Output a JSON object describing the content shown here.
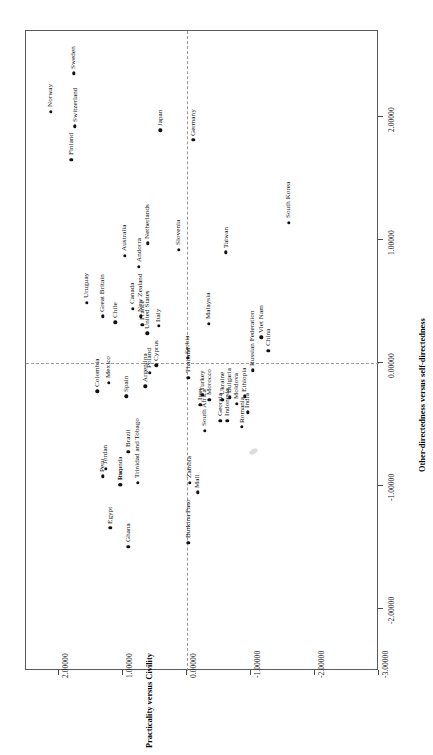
{
  "chart_data": {
    "type": "scatter",
    "title": "",
    "xlabel": "Practicality versus Civility",
    "ylabel": "Other-directedness versus self-directedness",
    "xlim": [
      2.0,
      -3.0
    ],
    "ylim": [
      -2.6,
      2.6
    ],
    "xticks": [
      "2.00000",
      "1.00000",
      "0.00000",
      "-1.00000",
      "-2.00000",
      "-3.00000"
    ],
    "xtickvalues": [
      2.0,
      1.0,
      0.0,
      -1.0,
      -2.0,
      -3.0
    ],
    "yticks": [
      "-2.00000",
      "-1.00000",
      "0.00000",
      "1.00000",
      "2.00000"
    ],
    "ytickvalues": [
      -2.0,
      -1.0,
      0.0,
      1.0,
      2.0
    ],
    "grid": false,
    "reference_lines": {
      "x": 0.0,
      "y": 0.0,
      "style": "dashed"
    },
    "orientation": "rotated-90-ccw",
    "legend": null,
    "points": [
      {
        "label": "Sweden",
        "x": 1.77,
        "y": 2.35
      },
      {
        "label": "Norway",
        "x": 2.13,
        "y": 2.04
      },
      {
        "label": "Switzerland",
        "x": 1.75,
        "y": 1.92
      },
      {
        "label": "Finland",
        "x": 1.81,
        "y": 1.65
      },
      {
        "label": "Japan",
        "x": 0.42,
        "y": 1.89
      },
      {
        "label": "Germany",
        "x": -0.1,
        "y": 1.81
      },
      {
        "label": "Uruguay",
        "x": 1.57,
        "y": 0.49
      },
      {
        "label": "Great Britain",
        "x": 1.32,
        "y": 0.38
      },
      {
        "label": "Australia",
        "x": 0.97,
        "y": 0.87
      },
      {
        "label": "Andorra",
        "x": 0.75,
        "y": 0.78
      },
      {
        "label": "Netherlands",
        "x": 0.61,
        "y": 0.97
      },
      {
        "label": "Canada",
        "x": 0.85,
        "y": 0.44
      },
      {
        "label": "Chile",
        "x": 1.12,
        "y": 0.33
      },
      {
        "label": "New Zealand",
        "x": 0.72,
        "y": 0.38
      },
      {
        "label": "France",
        "x": 0.7,
        "y": 0.31
      },
      {
        "label": "United States",
        "x": 0.62,
        "y": 0.24
      },
      {
        "label": "Italy",
        "x": 0.44,
        "y": 0.3
      },
      {
        "label": "Slovenia",
        "x": 0.13,
        "y": 0.92
      },
      {
        "label": "Taiwan",
        "x": -0.61,
        "y": 0.9
      },
      {
        "label": "South Korea",
        "x": -1.59,
        "y": 1.14
      },
      {
        "label": "Malaysia",
        "x": -0.34,
        "y": 0.32
      },
      {
        "label": "Cyprus",
        "x": 0.48,
        "y": -0.02
      },
      {
        "label": "Poland",
        "x": 0.58,
        "y": -0.08
      },
      {
        "label": "Mexico",
        "x": 1.22,
        "y": -0.16
      },
      {
        "label": "Colombia",
        "x": 1.4,
        "y": -0.23
      },
      {
        "label": "Spain",
        "x": 0.95,
        "y": -0.27
      },
      {
        "label": "Argentina",
        "x": 0.65,
        "y": -0.19
      },
      {
        "label": "Serbia",
        "x": -0.01,
        "y": 0.04
      },
      {
        "label": "Thailand",
        "x": -0.02,
        "y": -0.12
      },
      {
        "label": "Russian Federation",
        "x": -1.03,
        "y": -0.06
      },
      {
        "label": "China",
        "x": -1.27,
        "y": 0.1
      },
      {
        "label": "Viet Nam",
        "x": -1.16,
        "y": 0.21
      },
      {
        "label": "Turkey",
        "x": -0.24,
        "y": -0.26
      },
      {
        "label": "Iran",
        "x": -0.21,
        "y": -0.34
      },
      {
        "label": "Morocco",
        "x": -0.35,
        "y": -0.3
      },
      {
        "label": "Ukraine",
        "x": -0.55,
        "y": -0.3
      },
      {
        "label": "Bulgaria",
        "x": -0.67,
        "y": -0.28
      },
      {
        "label": "Moldova",
        "x": -0.78,
        "y": -0.33
      },
      {
        "label": "Ethiopia",
        "x": -0.9,
        "y": -0.27
      },
      {
        "label": "India",
        "x": -0.95,
        "y": -0.4
      },
      {
        "label": "Indonesia",
        "x": -0.63,
        "y": -0.47
      },
      {
        "label": "Georgia",
        "x": -0.52,
        "y": -0.47
      },
      {
        "label": "Romania",
        "x": -0.86,
        "y": -0.52
      },
      {
        "label": "Brazil",
        "x": 0.92,
        "y": -0.72
      },
      {
        "label": "South Africa",
        "x": -0.28,
        "y": -0.55
      },
      {
        "label": "Peru",
        "x": 1.32,
        "y": -0.92
      },
      {
        "label": "Jordan",
        "x": 1.27,
        "y": -0.86
      },
      {
        "label": "Iraq",
        "x": 1.04,
        "y": -0.99
      },
      {
        "label": "Rwanda",
        "x": 1.04,
        "y": -0.99
      },
      {
        "label": "Trinidad and Tobago",
        "x": 0.77,
        "y": -0.97
      },
      {
        "label": "Zambia",
        "x": -0.04,
        "y": -0.97
      },
      {
        "label": "Mali",
        "x": -0.17,
        "y": -1.05
      },
      {
        "label": "Egypt",
        "x": 1.2,
        "y": -1.34
      },
      {
        "label": "Ghana",
        "x": 0.92,
        "y": -1.49
      },
      {
        "label": "Burkina Faso",
        "x": -0.02,
        "y": -1.46
      }
    ]
  },
  "axes": {
    "x_title": "Practicality versus Civility",
    "y_title": "Other-directedness versus self-directedness"
  }
}
